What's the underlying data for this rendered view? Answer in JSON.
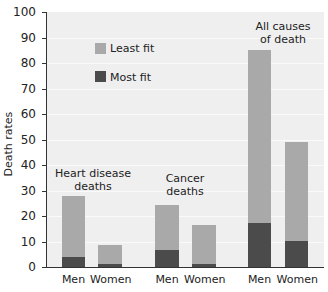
{
  "chart_data": {
    "type": "bar",
    "stacked": true,
    "title": "",
    "xlabel": "",
    "ylabel": "Death rates",
    "ylim": [
      0,
      100
    ],
    "yticks": [
      0,
      10,
      20,
      30,
      40,
      50,
      60,
      70,
      80,
      90,
      100
    ],
    "grid": true,
    "legend_position": "upper-left-inside",
    "groups": [
      {
        "label": "Heart disease deaths",
        "categories": [
          "Men",
          "Women"
        ]
      },
      {
        "label": "Cancer deaths",
        "categories": [
          "Men",
          "Women"
        ]
      },
      {
        "label": "All causes of death",
        "categories": [
          "Men",
          "Women"
        ]
      }
    ],
    "categories": [
      "Men",
      "Women",
      "Men",
      "Women",
      "Men",
      "Women"
    ],
    "series": [
      {
        "name": "Least fit",
        "color": "#a9a9a9",
        "values": [
          28,
          8.7,
          24.4,
          16.5,
          85,
          49
        ]
      },
      {
        "name": "Most fit",
        "color": "#4b4b4b",
        "values": [
          4,
          1.2,
          6.7,
          1,
          17.3,
          10
        ]
      }
    ],
    "note": "Least fit values are total bar heights; Most fit bars are overlaid from baseline."
  },
  "labels": {
    "ylabel": "Death rates",
    "yticks": [
      "0",
      "10",
      "20",
      "30",
      "40",
      "50",
      "60",
      "70",
      "80",
      "90",
      "100"
    ],
    "groups": [
      "Heart disease\ndeaths",
      "Cancer\ndeaths",
      "All causes\nof death"
    ],
    "x": [
      "Men",
      "Women",
      "Men",
      "Women",
      "Men",
      "Women"
    ],
    "legend": [
      "Least fit",
      "Most fit"
    ]
  },
  "colors": {
    "least_fit": "#a9a9a9",
    "most_fit": "#4b4b4b",
    "plot_bg": "#efefef"
  }
}
